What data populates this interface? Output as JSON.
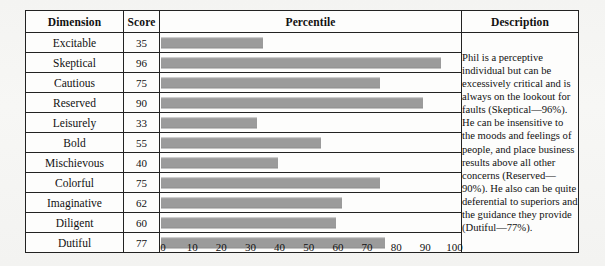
{
  "figure": {
    "columns": [
      "Dimension",
      "Score",
      "Percentile",
      "Description"
    ],
    "rows": [
      {
        "dimension": "Excitable",
        "score": 35
      },
      {
        "dimension": "Skeptical",
        "score": 96
      },
      {
        "dimension": "Cautious",
        "score": 75
      },
      {
        "dimension": "Reserved",
        "score": 90
      },
      {
        "dimension": "Leisurely",
        "score": 33
      },
      {
        "dimension": "Bold",
        "score": 55
      },
      {
        "dimension": "Mischievous",
        "score": 40
      },
      {
        "dimension": "Colorful",
        "score": 75
      },
      {
        "dimension": "Imaginative",
        "score": 62
      },
      {
        "dimension": "Diligent",
        "score": 60
      },
      {
        "dimension": "Dutiful",
        "score": 77
      }
    ],
    "description": "Phil is a perceptive individual but can be excessively critical and is always on the lookout for faults (Skeptical—96%). He can be insensitive to the moods and feelings of people, and place business results above all other concerns (Reserved—90%). He also can be quite deferential to superiors and the guidance they provide (Dutiful—77%).",
    "axis_ticks": [
      "0",
      "10",
      "20",
      "30",
      "40",
      "50",
      "60",
      "70",
      "80",
      "90",
      "100"
    ],
    "bar_color": "#9b9b9b",
    "border_color": "#222222",
    "background_color": "#fdfdfc"
  },
  "chart_data": {
    "type": "bar",
    "title": "",
    "xlabel": "",
    "ylabel": "",
    "orientation": "horizontal",
    "categories": [
      "Excitable",
      "Skeptical",
      "Cautious",
      "Reserved",
      "Leisurely",
      "Bold",
      "Mischievous",
      "Colorful",
      "Imaginative",
      "Diligent",
      "Dutiful"
    ],
    "values": [
      35,
      96,
      75,
      90,
      33,
      55,
      40,
      75,
      62,
      60,
      77
    ],
    "xlim": [
      0,
      100
    ],
    "xticks": [
      0,
      10,
      20,
      30,
      40,
      50,
      60,
      70,
      80,
      90,
      100
    ],
    "grid": false,
    "legend": "none",
    "series": [
      {
        "name": "Percentile",
        "values": [
          35,
          96,
          75,
          90,
          33,
          55,
          40,
          75,
          62,
          60,
          77
        ]
      }
    ]
  }
}
